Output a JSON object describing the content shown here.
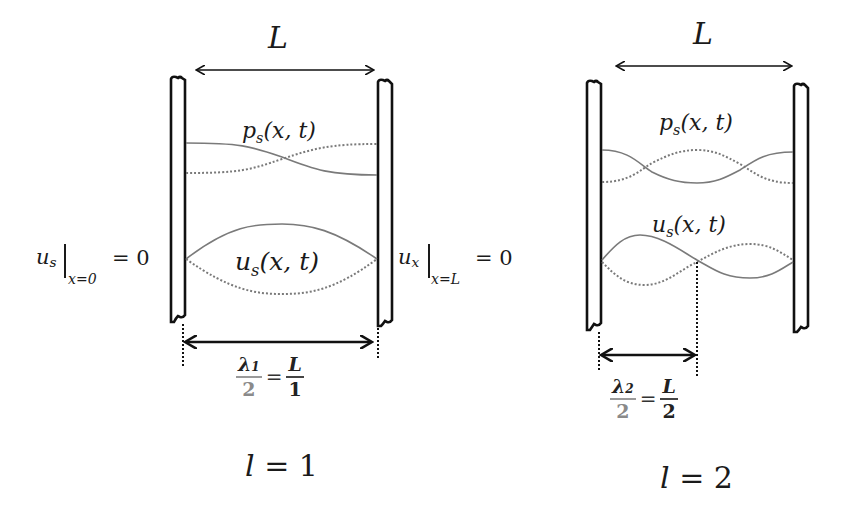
{
  "panels": [
    {
      "mode_label": "l = 1",
      "mode_l": "l",
      "mode_value": "1",
      "length_label": "L",
      "pressure_label": {
        "sym": "p",
        "sub": "s",
        "args": "(x, t)"
      },
      "displacement_label": {
        "sym": "u",
        "sub": "s",
        "args": "(x, t)"
      },
      "left_boundary": {
        "sym": "u",
        "sub": "s",
        "eval": "x=0",
        "rhs": "= 0"
      },
      "right_boundary": {
        "sym": "u",
        "sub": "x",
        "eval": "x=L",
        "rhs": "= 0"
      },
      "half_wavelength": {
        "lambda": "λ",
        "lambda_sub": "1",
        "den": "2",
        "eq": "=",
        "rhs_num": "L",
        "rhs_den": "1"
      }
    },
    {
      "mode_label": "l = 2",
      "mode_l": "l",
      "mode_value": "2",
      "length_label": "L",
      "pressure_label": {
        "sym": "p",
        "sub": "s",
        "args": "(x, t)"
      },
      "displacement_label": {
        "sym": "u",
        "sub": "s",
        "args": "(x, t)"
      },
      "half_wavelength": {
        "lambda": "λ",
        "lambda_sub": "2",
        "den": "2",
        "eq": "=",
        "rhs_num": "L",
        "rhs_den": "2"
      }
    }
  ],
  "colors": {
    "wall": "#111111",
    "curve_solid": "#7a7a7a",
    "curve_dotted": "#7a7a7a",
    "arrow": "#111111",
    "fraction_grey": "#8a8a8a"
  }
}
